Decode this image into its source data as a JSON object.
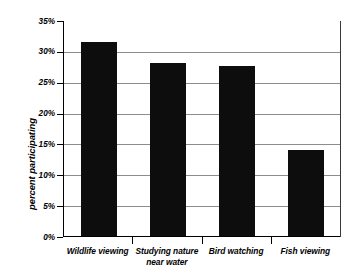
{
  "chart_data": {
    "type": "bar",
    "title": "",
    "subtitle": "",
    "xlabel": "",
    "ylabel": "percent participating",
    "categories": [
      "Wildlife viewing",
      "Studying nature\nnear water",
      "Bird watching",
      "Fish viewing"
    ],
    "values": [
      31.5,
      28.0,
      27.5,
      14.0
    ],
    "ylim": [
      0,
      35
    ],
    "ytick_values": [
      0,
      5,
      10,
      15,
      20,
      25,
      30,
      35
    ],
    "ytick_labels": [
      "0%",
      "5%",
      "10%",
      "15%",
      "20%",
      "25%",
      "30%",
      "35%"
    ],
    "grid": true,
    "grid_axis": "y",
    "legend": false,
    "legend_position": "none",
    "bar_color": "#0d0d0d",
    "gridline_color": "#8c8c8c",
    "axis_color": "#000000",
    "background_color": "#ffffff"
  }
}
